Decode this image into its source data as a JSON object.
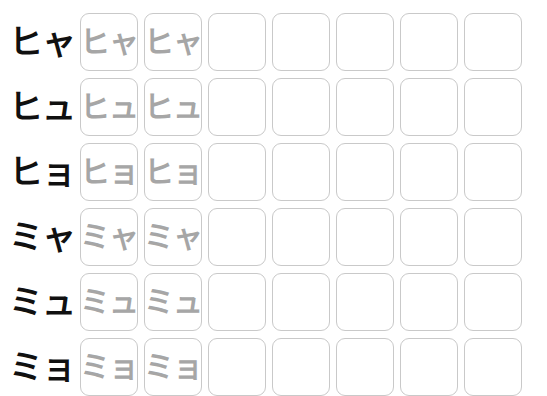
{
  "header": {
    "clipped_text": "・・・・・・"
  },
  "worksheet": {
    "title": "Katakana Yōon Writing Practice",
    "columns_total": 7,
    "traced_columns": 2,
    "blank_columns": 5,
    "colors": {
      "label_glyph": "#101010",
      "trace_glyph": "#a6a6a6",
      "cell_border": "#c9c9c9",
      "background": "#ffffff"
    },
    "rows": [
      {
        "id": "row-hya",
        "label": "ヒャ",
        "romaji": "hya",
        "cells": [
          {
            "state": "traced",
            "glyph": "ヒャ"
          },
          {
            "state": "traced",
            "glyph": "ヒャ"
          },
          {
            "state": "blank",
            "glyph": ""
          },
          {
            "state": "blank",
            "glyph": ""
          },
          {
            "state": "blank",
            "glyph": ""
          },
          {
            "state": "blank",
            "glyph": ""
          },
          {
            "state": "blank",
            "glyph": ""
          }
        ]
      },
      {
        "id": "row-hyu",
        "label": "ヒュ",
        "romaji": "hyu",
        "cells": [
          {
            "state": "traced",
            "glyph": "ヒュ"
          },
          {
            "state": "traced",
            "glyph": "ヒュ"
          },
          {
            "state": "blank",
            "glyph": ""
          },
          {
            "state": "blank",
            "glyph": ""
          },
          {
            "state": "blank",
            "glyph": ""
          },
          {
            "state": "blank",
            "glyph": ""
          },
          {
            "state": "blank",
            "glyph": ""
          }
        ]
      },
      {
        "id": "row-hyo",
        "label": "ヒョ",
        "romaji": "hyo",
        "cells": [
          {
            "state": "traced",
            "glyph": "ヒョ"
          },
          {
            "state": "traced",
            "glyph": "ヒョ"
          },
          {
            "state": "blank",
            "glyph": ""
          },
          {
            "state": "blank",
            "glyph": ""
          },
          {
            "state": "blank",
            "glyph": ""
          },
          {
            "state": "blank",
            "glyph": ""
          },
          {
            "state": "blank",
            "glyph": ""
          }
        ]
      },
      {
        "id": "row-mya",
        "label": "ミャ",
        "romaji": "mya",
        "cells": [
          {
            "state": "traced",
            "glyph": "ミャ"
          },
          {
            "state": "traced",
            "glyph": "ミャ"
          },
          {
            "state": "blank",
            "glyph": ""
          },
          {
            "state": "blank",
            "glyph": ""
          },
          {
            "state": "blank",
            "glyph": ""
          },
          {
            "state": "blank",
            "glyph": ""
          },
          {
            "state": "blank",
            "glyph": ""
          }
        ]
      },
      {
        "id": "row-myu",
        "label": "ミュ",
        "romaji": "myu",
        "cells": [
          {
            "state": "traced",
            "glyph": "ミュ"
          },
          {
            "state": "traced",
            "glyph": "ミュ"
          },
          {
            "state": "blank",
            "glyph": ""
          },
          {
            "state": "blank",
            "glyph": ""
          },
          {
            "state": "blank",
            "glyph": ""
          },
          {
            "state": "blank",
            "glyph": ""
          },
          {
            "state": "blank",
            "glyph": ""
          }
        ]
      },
      {
        "id": "row-myo",
        "label": "ミョ",
        "romaji": "myo",
        "cells": [
          {
            "state": "traced",
            "glyph": "ミョ"
          },
          {
            "state": "traced",
            "glyph": "ミョ"
          },
          {
            "state": "blank",
            "glyph": ""
          },
          {
            "state": "blank",
            "glyph": ""
          },
          {
            "state": "blank",
            "glyph": ""
          },
          {
            "state": "blank",
            "glyph": ""
          },
          {
            "state": "blank",
            "glyph": ""
          }
        ]
      }
    ]
  }
}
